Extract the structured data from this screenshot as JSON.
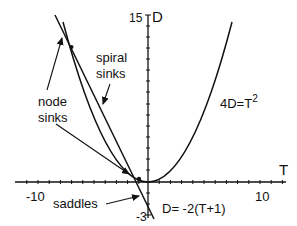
{
  "diagram": {
    "axes": {
      "x_label": "T",
      "y_label": "D",
      "x_tick_labels": [
        "-10",
        "10"
      ],
      "y_tick_labels": [
        "15",
        "-3"
      ]
    },
    "curves": {
      "parabola_label": "4D=T",
      "parabola_exponent": "2",
      "line_label": "D= -2(T+1)"
    },
    "annotations": {
      "spiral_line1": "spiral",
      "spiral_line2": "sinks",
      "node_line1": "node",
      "node_line2": "sinks",
      "saddles": "saddles"
    }
  }
}
